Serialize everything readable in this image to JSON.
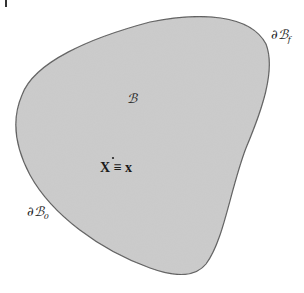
{
  "diagram": {
    "type": "continuum-body",
    "body": {
      "label": "ℬ",
      "fill_color": "#c8c8c8",
      "outline_color": "#555555"
    },
    "point": {
      "label_left": "X",
      "equiv": "≡",
      "label_right": "x",
      "dot": "•"
    },
    "boundaries": [
      {
        "name": "traction-boundary",
        "symbol": "∂ℬ",
        "subscript": "f"
      },
      {
        "name": "displacement-boundary",
        "symbol": "∂ℬ",
        "subscript": "0"
      }
    ]
  }
}
